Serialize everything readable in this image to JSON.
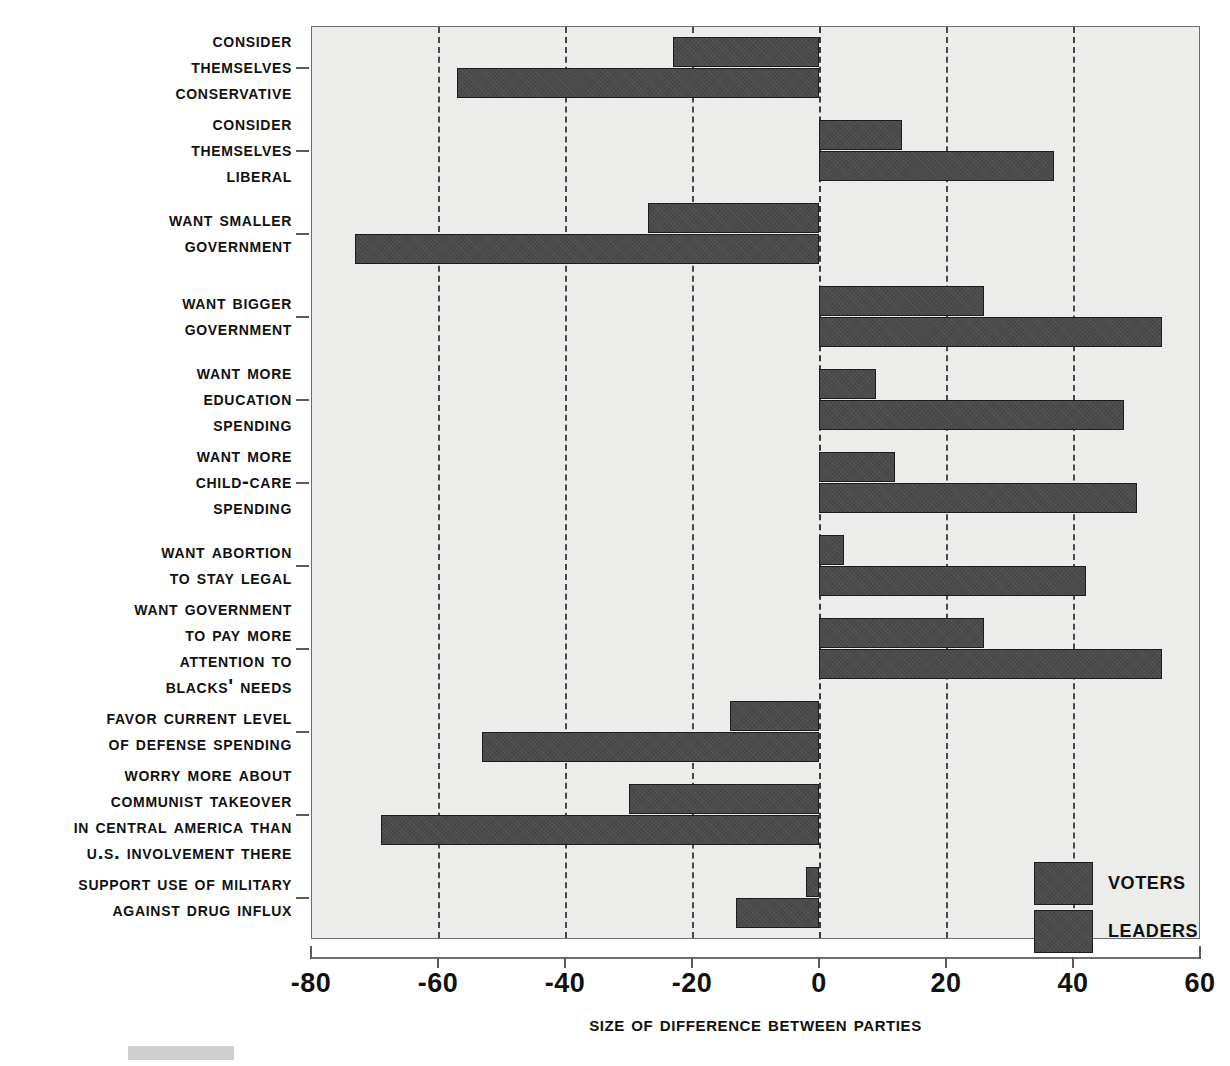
{
  "chart_data": {
    "type": "bar",
    "orientation": "horizontal",
    "title": "",
    "xlabel": "Size of Difference between Parties",
    "ylabel": "",
    "xlim": [
      -80,
      60
    ],
    "xticks": [
      -80,
      -60,
      -40,
      -20,
      0,
      20,
      40,
      60
    ],
    "xtick_labels": [
      "-80",
      "-60",
      "-40",
      "-20",
      "0",
      "20",
      "40",
      "60"
    ],
    "grid": "vertical dashed gridlines at every tick",
    "legend": [
      "Voters",
      "Leaders"
    ],
    "legend_position": "lower right inside plot area",
    "bar_color": "#4a4a4a",
    "plot_background": "#ececea",
    "categories": [
      "Consider themselves conservative",
      "Consider themselves liberal",
      "Want smaller government",
      "Want bigger government",
      "Want more education spending",
      "Want more child-care spending",
      "Want abortion to stay legal",
      "Want government to pay more attention to blacks' needs",
      "Favor current level of defense spending",
      "Worry more about communist takeover in Central America than U.S. involvement there",
      "Support use of military against drug influx"
    ],
    "series": [
      {
        "name": "Voters",
        "values": [
          -23,
          13,
          -27,
          26,
          9,
          12,
          4,
          26,
          -14,
          -30,
          -2
        ]
      },
      {
        "name": "Leaders",
        "values": [
          -57,
          37,
          -73,
          54,
          48,
          50,
          42,
          54,
          -53,
          -69,
          -13
        ]
      }
    ]
  },
  "labels": {
    "categories_multiline": [
      "Consider\nthemselves\nconservative",
      "Consider\nthemselves\nliberal",
      "Want smaller\ngovernment",
      "Want bigger\ngovernment",
      "Want more\neducation\nspending",
      "Want more\nchild-care\nspending",
      "Want abortion\nto stay legal",
      "Want government\nto pay more\nattention to\nblacks' needs",
      "Favor current level\nof defense spending",
      "Worry more about\ncommunist takeover\nin Central America than\nU.S. involvement there",
      "Support use of military\nagainst drug influx"
    ]
  },
  "axis": {
    "title": "Size of Difference between Parties",
    "ticks": [
      "-80",
      "-60",
      "-40",
      "-20",
      "0",
      "20",
      "40",
      "60"
    ]
  },
  "legend": {
    "voters": "Voters",
    "leaders": "Leaders"
  }
}
